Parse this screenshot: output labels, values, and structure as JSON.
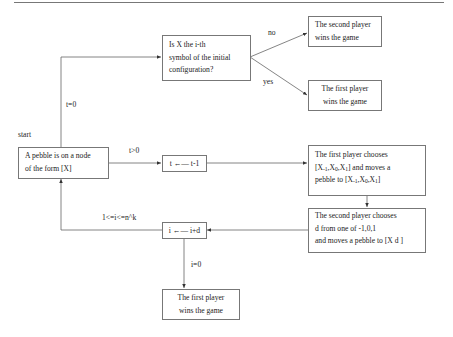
{
  "diagram": {
    "nodes": {
      "question": {
        "lines": [
          "Is X the i-th",
          "symbol of the initial",
          "configuration?"
        ]
      },
      "second_wins": {
        "lines": [
          "The second player",
          "wins the game"
        ]
      },
      "first_wins_top": {
        "lines": [
          "The first player",
          "wins the game"
        ]
      },
      "pebble": {
        "lines": [
          "A pebble is on a node",
          "of the form [X]"
        ]
      },
      "t_decrement": {
        "text": "t ←— t-1"
      },
      "first_chooses": {
        "line1": "The first player chooses",
        "line2_prefix": "[X",
        "line2_mid": "and moves a",
        "line3_prefix": "pebble to [X"
      },
      "second_chooses": {
        "lines": [
          "The second player chooses",
          "d from one of -1,0,1",
          "and moves a pebble to [X d ]"
        ]
      },
      "i_update": {
        "text": "i ←— i+d"
      },
      "first_wins_bottom": {
        "lines": [
          "The first player",
          "wins the game"
        ]
      }
    },
    "edge_labels": {
      "no": "no",
      "yes": "yes",
      "t_zero": "t=0",
      "start": "start",
      "t_positive": "t>0",
      "i_range": "1<=i<=n^k",
      "i_zero": "i=0"
    },
    "first_chooses_formula": {
      "x_minus1": "-1",
      "x0": "0",
      "x1": "1"
    }
  }
}
